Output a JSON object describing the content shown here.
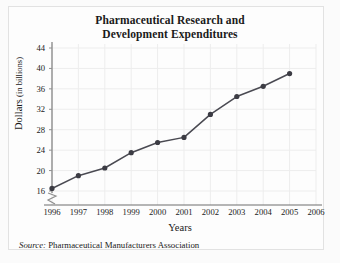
{
  "figure": {
    "title_line1": "Pharmaceutical Research and",
    "title_line2": "Development Expenditures",
    "source_label": "Source:",
    "source_text": " Pharmaceutical Manufacturers Association",
    "ylabel_main": "Dollars",
    "ylabel_unit": " (in billions)",
    "xlabel": "Years",
    "axis_break": "zigzag",
    "colors": {
      "line": "#4a4a52",
      "marker": "#3c3c44",
      "grid": "#ededed",
      "axis": "#8f8f8f",
      "text": "#1a1a1a",
      "panel_background": "#fdfdfd"
    }
  },
  "chart_data": {
    "type": "line",
    "title": "Pharmaceutical Research and Development Expenditures",
    "xlabel": "Years",
    "ylabel": "Dollars (in billions)",
    "x": [
      1996,
      1997,
      1998,
      1999,
      2000,
      2001,
      2002,
      2003,
      2004,
      2005
    ],
    "values": [
      16.5,
      19,
      20.5,
      23.5,
      25.5,
      26.5,
      31,
      34.5,
      36.5,
      39
    ],
    "series": [
      {
        "name": "R&D Expenditures",
        "values": [
          16.5,
          19,
          20.5,
          23.5,
          25.5,
          26.5,
          31,
          34.5,
          36.5,
          39
        ]
      }
    ],
    "x_ticks": [
      1996,
      1997,
      1998,
      1999,
      2000,
      2001,
      2002,
      2003,
      2004,
      2005,
      2006
    ],
    "x_tick_labels": [
      "1996",
      "1997",
      "1998",
      "1999",
      "2000",
      "2001",
      "2002",
      "2003",
      "2004",
      "2005",
      "2006"
    ],
    "y_ticks": [
      16,
      20,
      24,
      28,
      32,
      36,
      40,
      44
    ],
    "y_tick_labels": [
      "16",
      "20",
      "24",
      "28",
      "32",
      "36",
      "40",
      "44"
    ],
    "xlim": [
      1996,
      2006
    ],
    "ylim": [
      14,
      44
    ],
    "grid": true,
    "legend": "none",
    "marker": "circle",
    "y_axis_break_below": 16
  }
}
